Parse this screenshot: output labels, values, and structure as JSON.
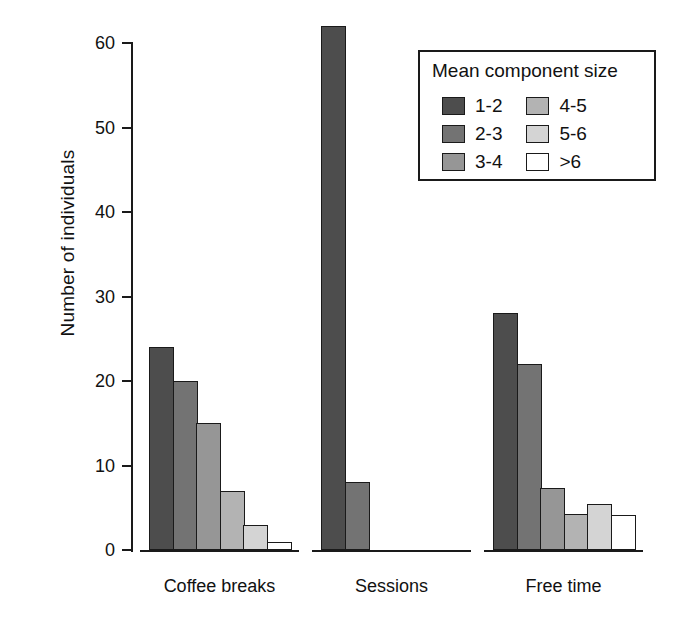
{
  "chart_data": {
    "type": "bar",
    "title": "",
    "xlabel": "",
    "ylabel": "Number of individuals",
    "categories": [
      "Coffee breaks",
      "Sessions",
      "Free time"
    ],
    "series": [
      {
        "name": "1-2",
        "color": "#4d4d4d",
        "values": [
          24,
          62,
          28
        ]
      },
      {
        "name": "2-3",
        "color": "#737373",
        "values": [
          20,
          8,
          22
        ]
      },
      {
        "name": "3-4",
        "color": "#969696",
        "values": [
          15,
          0,
          7.3
        ]
      },
      {
        "name": "4-5",
        "color": "#b3b3b3",
        "values": [
          7,
          0,
          4.3
        ]
      },
      {
        "name": "5-6",
        "color": "#d4d4d4",
        "values": [
          3,
          0,
          5.4
        ]
      },
      {
        "name": ">6",
        "color": "#ffffff",
        "values": [
          1,
          0,
          4.2
        ]
      }
    ],
    "ylim": [
      0,
      62
    ],
    "yticks": [
      0,
      10,
      20,
      30,
      40,
      50,
      60
    ],
    "ytick_labels": [
      "0",
      "10",
      "20",
      "30",
      "40",
      "50",
      "60"
    ],
    "grid": false,
    "legend": {
      "title": "Mean component size",
      "position": "top-right",
      "columns": 2,
      "entries": [
        {
          "label": "1-2",
          "color": "#4d4d4d"
        },
        {
          "label": "4-5",
          "color": "#b3b3b3"
        },
        {
          "label": "2-3",
          "color": "#737373"
        },
        {
          "label": "5-6",
          "color": "#d4d4d4"
        },
        {
          "label": "3-4",
          "color": "#969696"
        },
        {
          "label": ">6",
          "color": "#ffffff"
        }
      ]
    }
  },
  "axis": {
    "stroke": "#1a1a1a"
  }
}
